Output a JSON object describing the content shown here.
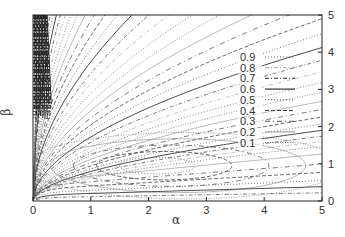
{
  "chart_data": {
    "type": "line",
    "subtype": "contour",
    "title": "",
    "xlabel": "α",
    "ylabel": "β",
    "xlim": [
      0,
      5
    ],
    "ylim": [
      0,
      5
    ],
    "x_ticks": [
      "0",
      "1",
      "2",
      "3",
      "4",
      "5"
    ],
    "y_ticks_right": [
      "0",
      "1",
      "2",
      "3",
      "4",
      "5"
    ],
    "grid": false,
    "legend_position": "right-center, inside plot",
    "series": [
      {
        "name": "0.9",
        "style": "dotted",
        "level": 0.9
      },
      {
        "name": "0.8",
        "style": "dash-dot light",
        "level": 0.8
      },
      {
        "name": "0.7",
        "style": "dash-dot",
        "level": 0.7
      },
      {
        "name": "0.6",
        "style": "solid",
        "level": 0.6
      },
      {
        "name": "0.5",
        "style": "dotted",
        "level": 0.5
      },
      {
        "name": "0.4",
        "style": "dashed",
        "level": 0.4
      },
      {
        "name": "0.3",
        "style": "dash-dot",
        "level": 0.3
      },
      {
        "name": "0.2",
        "style": "solid light",
        "level": 0.2
      },
      {
        "name": "0.1",
        "style": "dotted",
        "level": 0.1
      }
    ],
    "annotations": [
      "Dense periodic contour bands near α≈0 for large β",
      "Closed elliptical contours centered near α≈2, β≈1"
    ]
  },
  "axes": {
    "xlabel": "α",
    "ylabel": "β",
    "x_ticks": [
      "0",
      "1",
      "2",
      "3",
      "4",
      "5"
    ],
    "y_ticks": [
      "0",
      "1",
      "2",
      "3",
      "4",
      "5"
    ]
  },
  "legend": {
    "items": [
      "0.9",
      "0.8",
      "0.7",
      "0.6",
      "0.5",
      "0.4",
      "0.3",
      "0.2",
      "0.1"
    ]
  }
}
